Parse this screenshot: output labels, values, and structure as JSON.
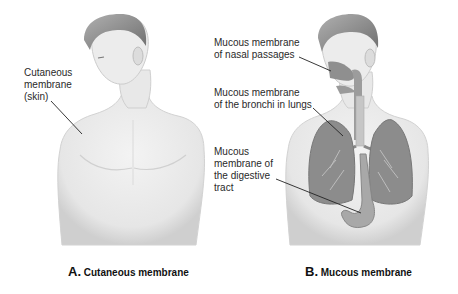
{
  "panels": {
    "a": {
      "letter": "A.",
      "caption": "Cutaneous membrane",
      "labels": [
        {
          "text": "Cutaneous\nmembrane\n(skin)"
        }
      ]
    },
    "b": {
      "letter": "B.",
      "caption": "Mucous membrane",
      "labels": [
        {
          "text": "Mucous membrane\nof nasal passages"
        },
        {
          "text": "Mucous membrane\nof the bronchi in lungs"
        },
        {
          "text": "Mucous\nmembrane of\nthe digestive\ntract"
        }
      ]
    }
  },
  "colors": {
    "skin": "#ececec",
    "skin_shadow": "#c8c8c8",
    "hair": "#8a8a8a",
    "organ": "#8c8c8c",
    "leader_line": "#222222"
  }
}
